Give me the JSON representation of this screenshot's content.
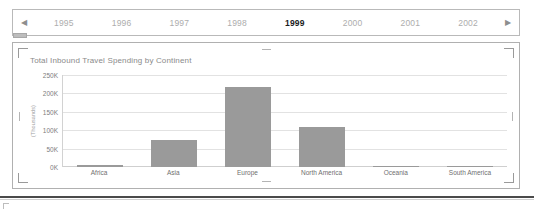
{
  "timeline": {
    "prev_label": "◀",
    "next_label": "▶",
    "prev_icon": "triangle-left-icon",
    "next_icon": "triangle-right-icon",
    "selected_year": "1999",
    "years": [
      {
        "label": "1995",
        "selected": false
      },
      {
        "label": "1996",
        "selected": false
      },
      {
        "label": "1997",
        "selected": false
      },
      {
        "label": "1998",
        "selected": false
      },
      {
        "label": "1999",
        "selected": true
      },
      {
        "label": "2000",
        "selected": false
      },
      {
        "label": "2001",
        "selected": false
      },
      {
        "label": "2002",
        "selected": false
      }
    ]
  },
  "chart_data": {
    "type": "bar",
    "title": "Total Inbound Travel Spending by Continent",
    "xlabel": "",
    "ylabel": "(Thousands)",
    "categories": [
      "Africa",
      "Asia",
      "Europe",
      "North America",
      "Oceania",
      "South America"
    ],
    "values": [
      5,
      75,
      220,
      110,
      4,
      3
    ],
    "ylim": [
      0,
      250
    ],
    "yticks": [
      250,
      200,
      150,
      100,
      50,
      0
    ],
    "ytick_labels": [
      "250K",
      "200K",
      "150K",
      "100K",
      "50K",
      "0K"
    ],
    "grid": true,
    "legend": false,
    "bar_color": "#9a9a9a",
    "gridline_color": "#e2e2e2",
    "axis_color": "#d2d2d2"
  },
  "selection": {
    "handles": [
      "top-left",
      "top-middle",
      "top-right",
      "left-middle",
      "right-middle",
      "bottom-left",
      "bottom-middle",
      "bottom-right"
    ]
  }
}
